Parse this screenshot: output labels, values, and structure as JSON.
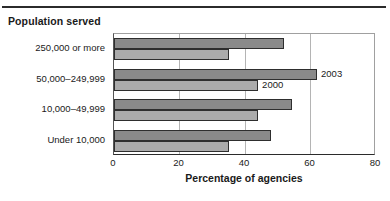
{
  "header": {
    "ghost_text": "",
    "divider": "horizontal-rule"
  },
  "chart_data": {
    "type": "bar",
    "orientation": "horizontal",
    "title": "Population served",
    "xlabel": "Percentage of agencies",
    "ylabel": "",
    "xlim": [
      0,
      80
    ],
    "xticks": [
      "0",
      "20",
      "40",
      "60",
      "80"
    ],
    "xtick_values": [
      0,
      20,
      40,
      60,
      80
    ],
    "gridlines": [
      20,
      40,
      60
    ],
    "grid": true,
    "legend_position": "inline-annotation",
    "categories": [
      "250,000 or more",
      "50,000–249,999",
      "10,000–49,999",
      "Under 10,000"
    ],
    "series": [
      {
        "name": "2003",
        "color": "#8a8a8a",
        "values": [
          52,
          62,
          54.5,
          48
        ]
      },
      {
        "name": "2000",
        "color": "#ababab",
        "values": [
          35,
          44,
          44,
          35
        ]
      }
    ],
    "annotations": [
      {
        "text": "2003",
        "series": "2003",
        "category": "50,000–249,999"
      },
      {
        "text": "2000",
        "series": "2000",
        "category": "50,000–249,999"
      }
    ]
  }
}
